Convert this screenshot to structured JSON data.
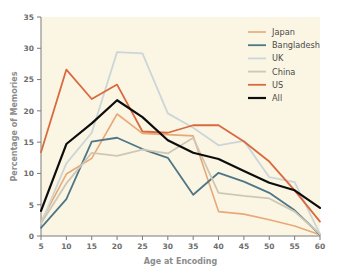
{
  "chart_data": {
    "type": "line",
    "title": "",
    "xlabel": "Age at Encoding",
    "ylabel": "Percentage of Memories",
    "x": [
      5,
      10,
      15,
      20,
      25,
      30,
      35,
      40,
      45,
      50,
      55,
      60
    ],
    "xticklabels": [
      "5",
      "10",
      "15",
      "20",
      "25",
      "30",
      "35",
      "40",
      "45",
      "50",
      "55",
      "60"
    ],
    "yticklabels": [
      "0",
      "5",
      "10",
      "15",
      "20",
      "25",
      "30",
      "35"
    ],
    "xlim": [
      5,
      60
    ],
    "ylim": [
      0,
      35
    ],
    "grid": false,
    "legend_position": "top-right",
    "background_color": "#fbf6e4",
    "series": [
      {
        "name": "Japan",
        "color": "#e8a878",
        "width": 1.6,
        "values": [
          2.3,
          9.9,
          12.4,
          19.5,
          16.4,
          16.2,
          16.0,
          3.9,
          3.5,
          2.6,
          1.6,
          0.2
        ]
      },
      {
        "name": "Bangladesh",
        "color": "#4e7686",
        "width": 1.8,
        "values": [
          1.3,
          5.9,
          15.1,
          15.7,
          13.9,
          12.5,
          6.6,
          10.1,
          8.7,
          6.9,
          4.1,
          0.2
        ]
      },
      {
        "name": "UK",
        "color": "#ccd5d8",
        "width": 1.8,
        "values": [
          2.0,
          11.6,
          16.5,
          29.4,
          29.2,
          19.6,
          17.3,
          14.5,
          15.2,
          9.4,
          8.6,
          0.3
        ]
      },
      {
        "name": "China",
        "color": "#cfc7b6",
        "width": 1.8,
        "values": [
          2.0,
          8.4,
          13.3,
          12.8,
          13.8,
          13.2,
          15.7,
          6.9,
          6.4,
          6.0,
          3.9,
          0.3
        ]
      },
      {
        "name": "US",
        "color": "#d96a3f",
        "width": 1.8,
        "values": [
          13.4,
          26.6,
          21.9,
          24.2,
          16.7,
          16.5,
          17.7,
          17.7,
          15.1,
          11.9,
          7.3,
          2.3
        ]
      },
      {
        "name": "All",
        "color": "#0d0d0d",
        "width": 2.2,
        "values": [
          4.0,
          14.7,
          18.0,
          21.7,
          19.0,
          15.3,
          13.3,
          12.3,
          10.4,
          8.5,
          7.3,
          4.5
        ]
      }
    ]
  },
  "legend": {
    "items": [
      {
        "label": "Japan"
      },
      {
        "label": "Bangladesh"
      },
      {
        "label": "UK"
      },
      {
        "label": "China"
      },
      {
        "label": "US"
      },
      {
        "label": "All"
      }
    ]
  },
  "axes": {
    "x_title": "Age at Encoding",
    "y_title": "Percentage of Memories"
  }
}
